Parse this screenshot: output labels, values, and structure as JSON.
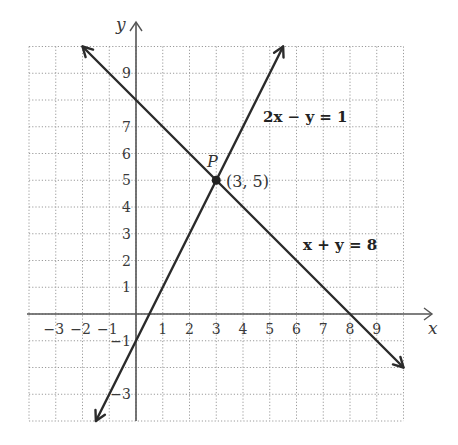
{
  "chart_data": {
    "type": "line",
    "title": "",
    "xlabel": "x",
    "ylabel": "y",
    "xlim": [
      -4,
      10
    ],
    "ylim": [
      -4,
      10
    ],
    "grid": true,
    "x_ticks": [
      -3,
      -2,
      -1,
      1,
      2,
      3,
      4,
      5,
      6,
      7,
      8,
      9
    ],
    "y_ticks": [
      9,
      7,
      6,
      5,
      4,
      3,
      2,
      1,
      -1,
      -3
    ],
    "x_tick_labels": [
      "−3",
      "−2",
      "−1",
      "1",
      "2",
      "3",
      "4",
      "5",
      "6",
      "7",
      "8",
      "9"
    ],
    "y_tick_labels": [
      "9",
      "7",
      "6",
      "5",
      "4",
      "3",
      "2",
      "1",
      "−1",
      "−3"
    ],
    "series": [
      {
        "name": "2x − y = 1",
        "equation": "y = 2x - 1",
        "x": [
          -1.5,
          5.5
        ],
        "y": [
          -4,
          10
        ]
      },
      {
        "name": "x + y = 8",
        "equation": "y = -x + 8",
        "x": [
          -2,
          10
        ],
        "y": [
          10,
          -2
        ]
      }
    ],
    "annotations": [
      {
        "type": "point",
        "name": "P",
        "x": 3,
        "y": 5,
        "label": "(3, 5)"
      }
    ],
    "legend": "inline labels"
  },
  "labels": {
    "x_axis": "x",
    "y_axis": "y",
    "eq1": "2x − y = 1",
    "eq2": "x + y = 8",
    "point_name": "P",
    "point_coords": "(3, 5)"
  }
}
